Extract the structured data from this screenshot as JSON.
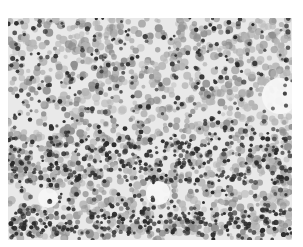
{
  "image": {
    "kind": "grayscale micrograph",
    "subject": "dense field of cells (dark round nuclei among lighter gray cells)",
    "frame": {
      "x": 8,
      "y": 18,
      "width": 284,
      "height": 222
    },
    "colors": {
      "background": "#e9e9e9",
      "light_cell": "#b5b5b5",
      "mid_cell": "#8f8f8f",
      "dark_nucleus": "#2b2b2b",
      "clear_area": "#f7f7f7"
    },
    "clear_regions": [
      {
        "cx": 272,
        "cy": 78,
        "r": 18
      },
      {
        "cx": 150,
        "cy": 175,
        "r": 12
      },
      {
        "cx": 40,
        "cy": 180,
        "r": 10
      }
    ]
  }
}
